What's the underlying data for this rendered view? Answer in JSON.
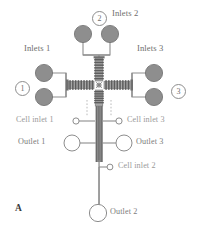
{
  "figure": {
    "panel_label": "A",
    "colors": {
      "reservoir_fill": "#8e8e8e",
      "reservoir_stroke": "#6f6f6f",
      "channel": "#8d8d8d",
      "channel_dark": "#6a6a6a",
      "label_gray": "#8a8a8a",
      "label_dark": "#5e5e5e",
      "background": "#ffffff"
    }
  },
  "labels": {
    "inlets_1": "Inlets 1",
    "inlets_2": "Inlets 2",
    "inlets_3": "Inlets 3",
    "cell_inlet_1": "Cell inlet 1",
    "cell_inlet_2": "Cell inlet 2",
    "cell_inlet_3": "Cell inlet 3",
    "outlet_1": "Outlet 1",
    "outlet_2": "Outlet 2",
    "outlet_3": "Outlet 3"
  },
  "markers": {
    "one": "1",
    "two": "2",
    "three": "3"
  },
  "diagram_data": {
    "type": "schematic",
    "reservoirs": [
      {
        "name": "inlet-1a",
        "cx": 44,
        "cy": 73,
        "r": 8.5,
        "group": "Inlets 1"
      },
      {
        "name": "inlet-1b",
        "cx": 44,
        "cy": 97,
        "r": 8.5,
        "group": "Inlets 1"
      },
      {
        "name": "inlet-2a",
        "cx": 83,
        "cy": 34,
        "r": 8.5,
        "group": "Inlets 2"
      },
      {
        "name": "inlet-2b",
        "cx": 110,
        "cy": 34,
        "r": 8.5,
        "group": "Inlets 2"
      },
      {
        "name": "inlet-3a",
        "cx": 154,
        "cy": 73,
        "r": 8.5,
        "group": "Inlets 3"
      },
      {
        "name": "inlet-3b",
        "cx": 154,
        "cy": 97,
        "r": 8.5,
        "group": "Inlets 3"
      }
    ],
    "ports": [
      {
        "name": "cell-inlet-1",
        "cx": 76,
        "cy": 121,
        "r": 3.1,
        "open": true
      },
      {
        "name": "cell-inlet-3",
        "cx": 119,
        "cy": 121,
        "r": 3.1,
        "open": true
      },
      {
        "name": "cell-inlet-2",
        "cx": 110,
        "cy": 167,
        "r": 2.9,
        "open": true
      },
      {
        "name": "outlet-1",
        "cx": 72,
        "cy": 143,
        "r": 8.0,
        "open": true
      },
      {
        "name": "outlet-3",
        "cx": 124,
        "cy": 143,
        "r": 8.0,
        "open": true
      },
      {
        "name": "outlet-2",
        "cx": 98,
        "cy": 213,
        "r": 8.5,
        "open": true
      }
    ],
    "mixer_units": {
      "left": {
        "x": 53,
        "y": 85,
        "n": 9,
        "orientation": "horizontal"
      },
      "right": {
        "x": 117,
        "y": 85,
        "n": 9,
        "orientation": "horizontal"
      },
      "top": {
        "x": 96,
        "y": 58,
        "n": 8,
        "orientation": "vertical"
      },
      "bottom": {
        "x": 96,
        "y": 94,
        "n": 8,
        "orientation": "vertical"
      }
    }
  }
}
